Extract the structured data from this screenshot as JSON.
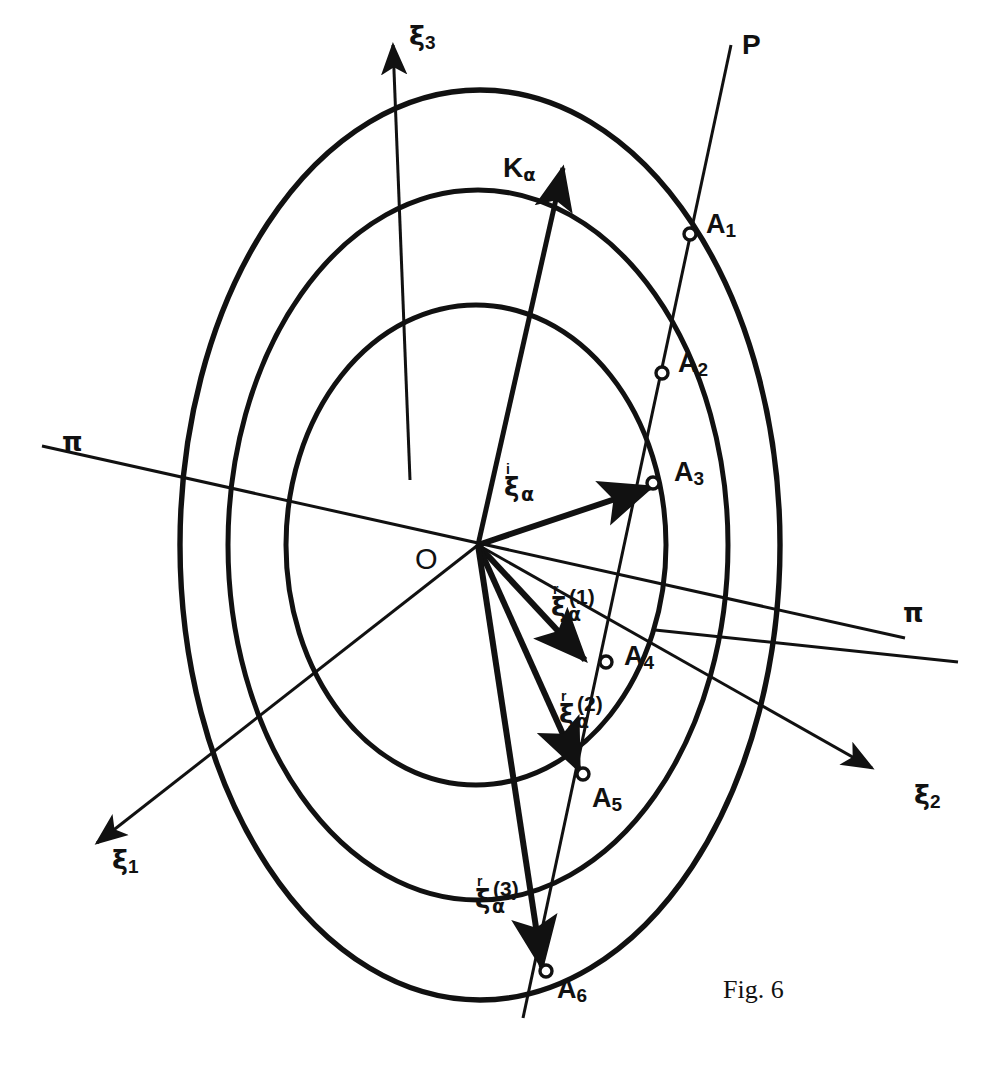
{
  "figure": {
    "caption": "Fig. 6",
    "origin_label": "O",
    "ray_label": "P",
    "stroke_color": "#111111",
    "background_color": "#ffffff"
  },
  "axes": [
    {
      "name": "xi-3",
      "symbol": "ξ",
      "sub": "3",
      "direction": "up"
    },
    {
      "name": "xi-2",
      "symbol": "ξ",
      "sub": "2",
      "direction": "down-right"
    },
    {
      "name": "xi-1",
      "symbol": "ξ",
      "sub": "1",
      "direction": "down-left"
    }
  ],
  "plane_traces": [
    {
      "name": "pi-left",
      "symbol": "π"
    },
    {
      "name": "pi-right",
      "symbol": "π"
    }
  ],
  "wave_vector": {
    "symbol": "K",
    "sub": "α",
    "label": "Kα"
  },
  "vectors": [
    {
      "name": "incident",
      "symbol": "ξ",
      "presup": "i",
      "sub": "α",
      "index": "",
      "target": "A3"
    },
    {
      "name": "reflected-1",
      "symbol": "ξ",
      "presup": "r",
      "sub": "α",
      "index": "(1)",
      "target": "A4"
    },
    {
      "name": "reflected-2",
      "symbol": "ξ",
      "presup": "r",
      "sub": "α",
      "index": "(2)",
      "target": "A5"
    },
    {
      "name": "reflected-3",
      "symbol": "ξ",
      "presup": "r",
      "sub": "α",
      "index": "(3)",
      "target": "A6"
    }
  ],
  "points": [
    {
      "name": "A1",
      "letter": "A",
      "sub": "1"
    },
    {
      "name": "A2",
      "letter": "A",
      "sub": "2"
    },
    {
      "name": "A3",
      "letter": "A",
      "sub": "3"
    },
    {
      "name": "A4",
      "letter": "A",
      "sub": "4"
    },
    {
      "name": "A5",
      "letter": "A",
      "sub": "5"
    },
    {
      "name": "A6",
      "letter": "A",
      "sub": "6"
    }
  ],
  "ellipses": [
    {
      "name": "outer-ellipse",
      "cx": 480,
      "cy": 545,
      "rx": 300,
      "ry": 455
    },
    {
      "name": "middle-ellipse",
      "cx": 478,
      "cy": 545,
      "rx": 250,
      "ry": 355
    },
    {
      "name": "inner-ellipse",
      "cx": 476,
      "cy": 545,
      "rx": 190,
      "ry": 240
    }
  ]
}
